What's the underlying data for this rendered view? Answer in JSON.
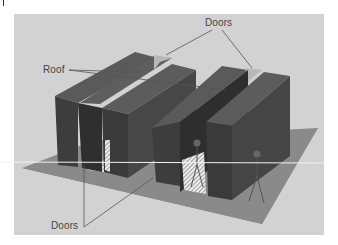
{
  "diagram": {
    "type": "3d-illustration",
    "labels": {
      "top_doors": "Doors",
      "roof": "Roof",
      "bottom_doors": "Doors"
    },
    "colors": {
      "background": "#d2d2d2",
      "floor": "#8e8e8e",
      "cabinet_front": "#3a3a3a",
      "cabinet_side": "#4c4c4c",
      "cabinet_top": "#5a5a5a",
      "roof_panel": "#b5b5b5",
      "leader_line": "#555555",
      "text": "#444444"
    },
    "elements": [
      {
        "name": "left-aisle-pod",
        "parts": [
          "left-cabinet-row",
          "right-cabinet-row",
          "roof",
          "door-top",
          "door-bottom"
        ]
      },
      {
        "name": "right-aisle-pod",
        "parts": [
          "left-cabinet-row",
          "right-cabinet-row",
          "roof",
          "door-top",
          "door-bottom"
        ]
      },
      {
        "name": "person-in-aisle"
      },
      {
        "name": "person-outside"
      }
    ]
  }
}
